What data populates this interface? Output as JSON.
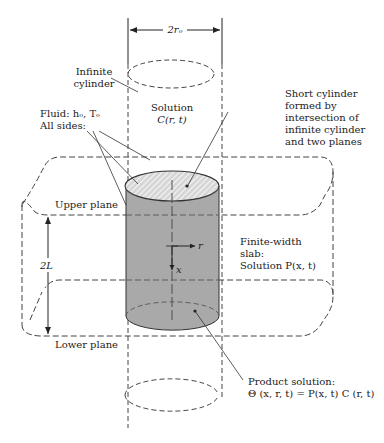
{
  "diagram": {
    "dimension_top": "2rₒ",
    "dimension_side": "2L",
    "labels": {
      "infinite_cylinder": [
        "Infinite",
        "cylinder"
      ],
      "solution_c": [
        "Solution",
        "C(r, t)"
      ],
      "fluid": [
        "Fluid: hₒ, Tₒ",
        "All sides:"
      ],
      "short_cylinder": [
        "Short cylinder",
        "formed by",
        "intersection of",
        "infinite cylinder",
        "and two planes"
      ],
      "upper_plane": "Upper plane",
      "lower_plane": "Lower plane",
      "slab": [
        "Finite-width",
        "slab:",
        "Solution P(x, t)"
      ],
      "product": [
        "Product solution:",
        "Θ (x, r, t) = P(x, t) C (r, t)"
      ],
      "axis_r": "r",
      "axis_x": "x"
    },
    "colors": {
      "cylinder_fill": "#a9a9a9",
      "hatch_fill": "#c8c8c8",
      "line": "#333333",
      "background": "#ffffff"
    }
  }
}
